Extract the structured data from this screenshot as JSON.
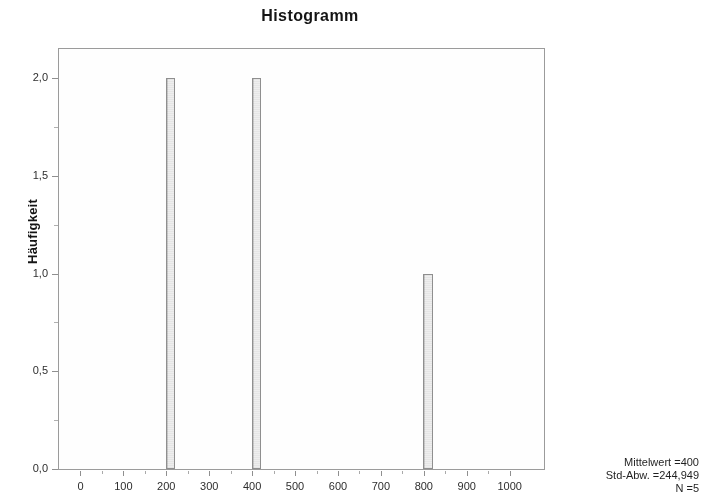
{
  "chart_data": {
    "type": "bar",
    "title": "Histogramm",
    "xlabel": "",
    "ylabel": "Häufigkeit",
    "categories": [
      "210",
      "410",
      "810"
    ],
    "values": [
      2,
      2,
      1
    ],
    "x": [
      210,
      410,
      810
    ],
    "xlim": [
      -50,
      1080
    ],
    "ylim": [
      0,
      2.15
    ],
    "grid": false,
    "legend": null,
    "bar_width_units": 22,
    "x_tick_labels": [
      "0",
      "100",
      "200",
      "300",
      "400",
      "500",
      "600",
      "700",
      "800",
      "900",
      "1000"
    ],
    "x_tick_values": [
      0,
      100,
      200,
      300,
      400,
      500,
      600,
      700,
      800,
      900,
      1000
    ],
    "y_tick_labels": [
      "0,0",
      "0,5",
      "1,0",
      "1,5",
      "2,0"
    ],
    "y_tick_values": [
      0,
      0.5,
      1.0,
      1.5,
      2.0
    ],
    "annotations": [
      "Mittelwert =400",
      "Std-Abw. =244,949",
      "N =5"
    ],
    "colors": {
      "bar_fill": "#e9e9e9",
      "bar_border": "#8e8e8e",
      "frame": "#9a9a9a",
      "text": "#1a1a1a",
      "background": "#ffffff"
    }
  },
  "stats": {
    "mean_label": "Mittelwert =400",
    "stddev_label": "Std-Abw. =244,949",
    "n_label": "N =5"
  }
}
